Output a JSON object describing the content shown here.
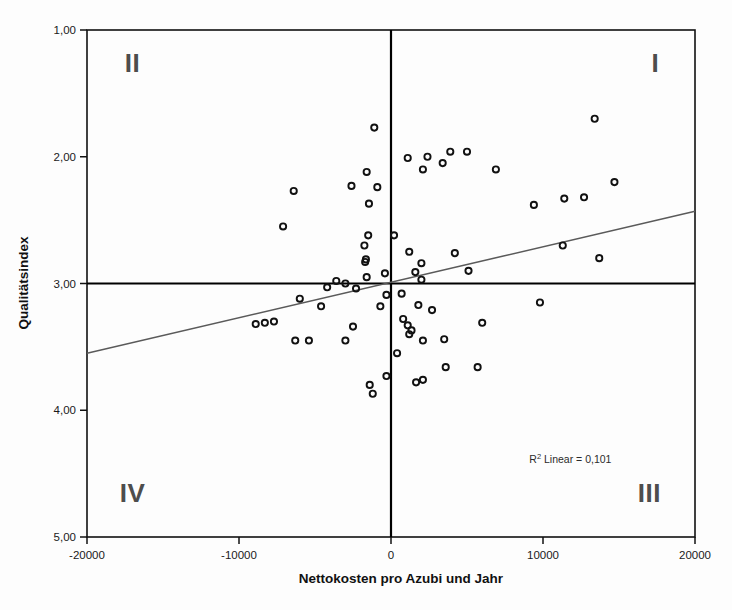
{
  "chart_data": {
    "type": "scatter",
    "title": "",
    "xlabel": "Nettokosten pro Azubi und Jahr",
    "ylabel": "Qualitätsindex",
    "xlim": [
      -20000,
      20000
    ],
    "ylim": [
      1.0,
      5.0
    ],
    "y_axis_inverted": true,
    "grid": false,
    "legend": "none",
    "xticks": [
      -20000,
      -10000,
      0,
      10000,
      20000
    ],
    "xticklabels": [
      "-20000",
      "-10000",
      "0",
      "10000",
      "20000"
    ],
    "yticks": [
      1.0,
      2.0,
      3.0,
      4.0,
      5.0
    ],
    "yticklabels": [
      "1,00",
      "2,00",
      "3,00",
      "4,00",
      "5,00"
    ],
    "reference_lines": {
      "vertical_x": 0,
      "horizontal_y": 3.0
    },
    "annotations": [
      {
        "name": "r2-annotation",
        "text": "R² Linear = 0,101",
        "x": 11800,
        "y": 4.42
      },
      {
        "name": "quadrant-label-II",
        "text": "II",
        "x": -17000,
        "y": 1.33
      },
      {
        "name": "quadrant-label-I",
        "text": "I",
        "x": 17400,
        "y": 1.33
      },
      {
        "name": "quadrant-label-IV",
        "text": "IV",
        "x": -17000,
        "y": 4.72
      },
      {
        "name": "quadrant-label-III",
        "text": "III",
        "x": 17000,
        "y": 4.72
      }
    ],
    "fit_line": {
      "type": "linear",
      "r_squared": 0.101,
      "label": "R² Linear = 0,101",
      "endpoints": [
        [
          -20000,
          3.55
        ],
        [
          20000,
          2.43
        ]
      ]
    },
    "points": [
      [
        -1100,
        1.77
      ],
      [
        -6400,
        2.27
      ],
      [
        -7100,
        2.55
      ],
      [
        -1600,
        2.12
      ],
      [
        -900,
        2.24
      ],
      [
        -2600,
        2.23
      ],
      [
        -1450,
        2.37
      ],
      [
        3900,
        1.96
      ],
      [
        1100,
        2.01
      ],
      [
        2400,
        2.0
      ],
      [
        2100,
        2.1
      ],
      [
        3400,
        2.05
      ],
      [
        5000,
        1.96
      ],
      [
        6900,
        2.1
      ],
      [
        13400,
        1.7
      ],
      [
        11400,
        2.33
      ],
      [
        12700,
        2.32
      ],
      [
        14700,
        2.2
      ],
      [
        9400,
        2.38
      ],
      [
        13700,
        2.8
      ],
      [
        1200,
        2.75
      ],
      [
        2000,
        2.84
      ],
      [
        4200,
        2.76
      ],
      [
        -1500,
        2.62
      ],
      [
        -1750,
        2.7
      ],
      [
        -1650,
        2.81
      ],
      [
        -1700,
        2.83
      ],
      [
        200,
        2.62
      ],
      [
        -400,
        2.92
      ],
      [
        1600,
        2.91
      ],
      [
        2000,
        2.97
      ],
      [
        5100,
        2.9
      ],
      [
        11300,
        2.7
      ],
      [
        -1600,
        2.95
      ],
      [
        -3000,
        3.0
      ],
      [
        -4200,
        3.03
      ],
      [
        -3600,
        2.98
      ],
      [
        -2300,
        3.04
      ],
      [
        -6000,
        3.12
      ],
      [
        -8300,
        3.31
      ],
      [
        -8900,
        3.32
      ],
      [
        -7700,
        3.3
      ],
      [
        -6300,
        3.45
      ],
      [
        -5400,
        3.45
      ],
      [
        -300,
        3.09
      ],
      [
        -700,
        3.18
      ],
      [
        700,
        3.08
      ],
      [
        -4600,
        3.18
      ],
      [
        800,
        3.28
      ],
      [
        1800,
        3.17
      ],
      [
        1100,
        3.33
      ],
      [
        1350,
        3.37
      ],
      [
        1200,
        3.4
      ],
      [
        2100,
        3.45
      ],
      [
        2700,
        3.21
      ],
      [
        400,
        3.55
      ],
      [
        3500,
        3.44
      ],
      [
        6000,
        3.31
      ],
      [
        9800,
        3.15
      ],
      [
        3600,
        3.66
      ],
      [
        1650,
        3.78
      ],
      [
        2100,
        3.76
      ],
      [
        -1200,
        3.87
      ],
      [
        -300,
        3.73
      ],
      [
        -3000,
        3.45
      ],
      [
        -2500,
        3.34
      ],
      [
        5700,
        3.66
      ],
      [
        -1400,
        3.8
      ]
    ]
  },
  "axes": {
    "x_title": "Nettokosten pro Azubi und Jahr",
    "y_title": "Qualitätsindex"
  }
}
